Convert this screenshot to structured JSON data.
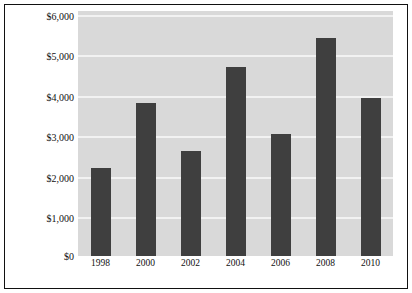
{
  "chart_data": {
    "type": "bar",
    "title": "",
    "xlabel": "",
    "ylabel": "SPENDING (MILLIONS)",
    "categories": [
      "1998",
      "2000",
      "2002",
      "2004",
      "2006",
      "2008",
      "2010"
    ],
    "values": [
      2150,
      3740,
      2560,
      4620,
      3000,
      5330,
      3870
    ],
    "ylim": [
      0,
      6000
    ],
    "ytick_values": [
      6000,
      5000,
      4000,
      3000,
      2000,
      1000,
      0
    ],
    "ytick_labels": [
      "$6,000",
      "$5,000",
      "$4,000",
      "$3,000",
      "$2,000",
      "$1,000",
      "$0"
    ],
    "grid": true,
    "grid_axis": "y",
    "legend": false,
    "legend_position": "none",
    "colors": {
      "bar": "#3f3f3f",
      "plot_background": "#d9d9d9",
      "gridline": "#f2f2f2",
      "figure_background": "#ffffff",
      "frame": "#111111",
      "text": "#111111"
    }
  }
}
